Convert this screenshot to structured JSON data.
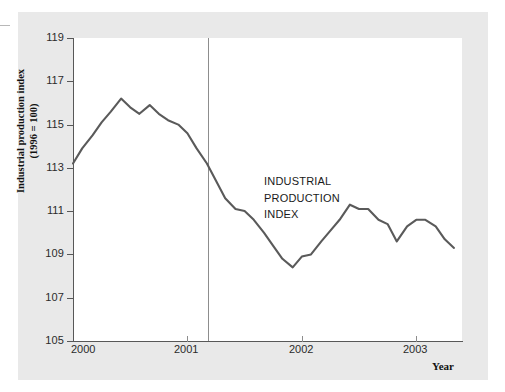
{
  "figure": {
    "background_color": "#e9e9e9",
    "plot_background_color": "#ffffff",
    "axis_color": "#585858",
    "line_color": "#5a5a5a",
    "marker_line_color": "#8d8d8d"
  },
  "annotation": {
    "line1": "INDUSTRIAL",
    "line2": "PRODUCTION",
    "line3": "INDEX"
  },
  "axis_titles": {
    "y_line1": "Industrial production index",
    "y_line2": "(1996 = 100)",
    "x": "Year"
  },
  "chart_data": {
    "type": "line",
    "title": "",
    "xlabel": "Year",
    "ylabel": "Industrial production index (1996 = 100)",
    "ylim": [
      105,
      119
    ],
    "xlim": [
      2000.0,
      2003.4
    ],
    "grid": false,
    "legend": null,
    "y_ticks": [
      105,
      107,
      109,
      111,
      113,
      115,
      117,
      119
    ],
    "x_ticks": [
      2000,
      2001,
      2002,
      2003
    ],
    "x_tick_labels": [
      "2000",
      "2001",
      "2002",
      "2003"
    ],
    "annotations": [
      {
        "text": "INDUSTRIAL PRODUCTION INDEX",
        "x": 2002.3,
        "y": 112.4
      },
      {
        "type": "vline",
        "label": "",
        "x": 2001.18
      }
    ],
    "series": [
      {
        "name": "Industrial production index",
        "x": [
          2000.0,
          2000.08,
          2000.17,
          2000.25,
          2000.33,
          2000.42,
          2000.5,
          2000.58,
          2000.67,
          2000.75,
          2000.83,
          2000.92,
          2001.0,
          2001.08,
          2001.17,
          2001.25,
          2001.33,
          2001.42,
          2001.5,
          2001.58,
          2001.67,
          2001.75,
          2001.83,
          2001.92,
          2002.0,
          2002.08,
          2002.17,
          2002.25,
          2002.33,
          2002.42,
          2002.5,
          2002.58,
          2002.67,
          2002.75,
          2002.83,
          2002.92,
          2003.0,
          2003.08,
          2003.17,
          2003.25,
          2003.33
        ],
        "values": [
          113.2,
          113.9,
          114.5,
          115.1,
          115.6,
          116.2,
          115.8,
          115.5,
          115.9,
          115.5,
          115.2,
          115.0,
          114.6,
          113.9,
          113.2,
          112.4,
          111.6,
          111.1,
          111.0,
          110.6,
          110.0,
          109.4,
          108.8,
          108.4,
          108.9,
          109.0,
          109.6,
          110.1,
          110.6,
          111.3,
          111.1,
          111.1,
          110.6,
          110.4,
          109.6,
          110.3,
          110.6,
          110.6,
          110.3,
          109.7,
          109.3
        ]
      }
    ]
  }
}
